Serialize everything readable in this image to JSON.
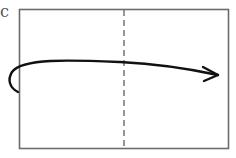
{
  "diagram": {
    "label": "c",
    "colors": {
      "frame": "#6b6b6b",
      "fold_line": "#6b6b6b",
      "arrow": "#111111",
      "background": "#ffffff"
    },
    "frame": {
      "x": 19,
      "y": 9,
      "width": 210,
      "height": 140
    },
    "fold_line": {
      "x": 124,
      "style": "dashed"
    },
    "arrow": {
      "start": [
        18,
        92
      ],
      "end": [
        218,
        75
      ],
      "direction": "left-to-right fold-over"
    }
  }
}
